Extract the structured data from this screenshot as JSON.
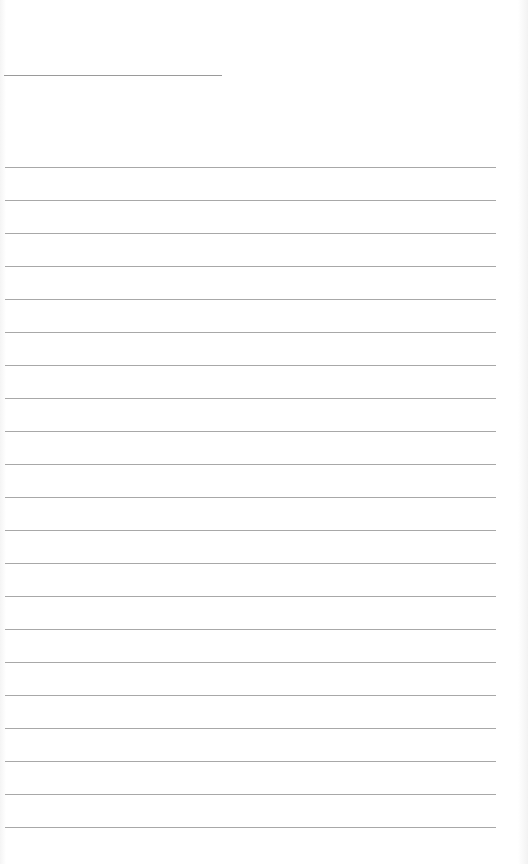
{
  "page": {
    "type": "lined-notepad-page",
    "title_line": {
      "y": 75,
      "x_start": 4,
      "x_end": 222
    },
    "ruled_lines": {
      "count": 21,
      "first_y": 167,
      "spacing": 33,
      "x_start": 5,
      "x_end": 496
    },
    "colors": {
      "background": "#ffffff",
      "line": "#a8a8a8"
    }
  }
}
